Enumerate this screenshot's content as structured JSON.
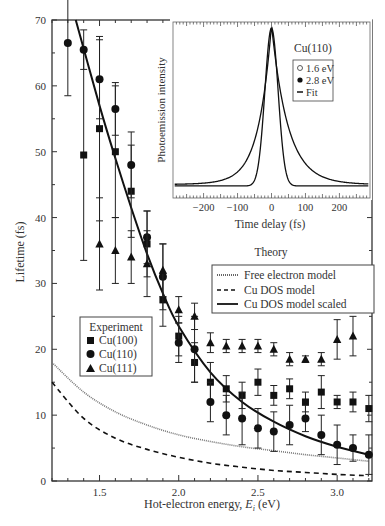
{
  "chart_data": [
    {
      "type": "scatter",
      "title": "",
      "xlabel": "Hot-electron energy, E_i (eV)",
      "xlabel_main": "Hot-electron energy, ",
      "xlabel_sym": "E",
      "xlabel_sub": "i",
      "xlabel_unit": " (eV)",
      "ylabel": "Lifetime (fs)",
      "xlim": [
        1.2,
        3.22
      ],
      "ylim": [
        0,
        70
      ],
      "xticks": [
        1.5,
        2.0,
        2.5,
        3.0
      ],
      "xtick_labels": [
        "1.5",
        "2.0",
        "2.5",
        "3.0"
      ],
      "yticks": [
        0,
        10,
        20,
        30,
        40,
        50,
        60,
        70
      ],
      "ytick_labels": [
        "0",
        "10",
        "20",
        "30",
        "40",
        "50",
        "60",
        "70"
      ],
      "grid": false,
      "legend_experiment": {
        "title": "Experiment",
        "entries": [
          "Cu(100)",
          "Cu(110)",
          "Cu(111)"
        ]
      },
      "legend_theory": {
        "title": "Theory",
        "entries": [
          "Free electron model",
          "Cu DOS model",
          "Cu DOS model scaled"
        ]
      },
      "series": [
        {
          "name": "Cu(100)",
          "marker": "square",
          "x": [
            1.4,
            1.5,
            1.6,
            1.7,
            1.8,
            1.9,
            2.0,
            2.1,
            2.2,
            2.3,
            2.4,
            2.5,
            2.6,
            2.7,
            2.8,
            2.9,
            3.0,
            3.1,
            3.2
          ],
          "y": [
            49.5,
            53.5,
            50,
            44,
            36,
            27.5,
            22,
            18,
            15,
            14,
            13,
            15,
            13,
            14,
            12,
            13.5,
            12,
            12,
            11
          ],
          "err": [
            16,
            14,
            10,
            7,
            5,
            4,
            3,
            3,
            3,
            2,
            2,
            2,
            1.5,
            1.5,
            1.5,
            2.5,
            1,
            1.5,
            2
          ]
        },
        {
          "name": "Cu(110)",
          "marker": "circle",
          "x": [
            1.3,
            1.4,
            1.5,
            1.6,
            1.7,
            1.8,
            1.9,
            2.0,
            2.1,
            2.2,
            2.3,
            2.4,
            2.5,
            2.6,
            2.7,
            2.8,
            2.9,
            3.0,
            3.1,
            3.2
          ],
          "y": [
            66.5,
            65.5,
            61,
            56.5,
            48,
            37,
            31,
            21,
            20,
            12,
            10,
            9.5,
            8,
            7.5,
            8.5,
            9.5,
            7,
            5.5,
            5,
            4
          ],
          "err": [
            8,
            3,
            6,
            4,
            5,
            4,
            5,
            3,
            5,
            3,
            3,
            4,
            3,
            3,
            3,
            2,
            3,
            3,
            2,
            3
          ]
        },
        {
          "name": "Cu(111)",
          "marker": "triangle",
          "x": [
            1.5,
            1.6,
            1.7,
            1.8,
            1.9,
            2.0,
            2.1,
            2.2,
            2.3,
            2.4,
            2.5,
            2.6,
            2.7,
            2.8,
            2.9,
            3.0,
            3.1
          ],
          "y": [
            36,
            35,
            34,
            33,
            32,
            26,
            25,
            21,
            20.5,
            20.5,
            20.5,
            20,
            18.5,
            18.5,
            18.5,
            21.5,
            22
          ],
          "err": [
            7,
            5,
            4,
            5,
            4,
            2,
            2,
            1.5,
            1,
            1,
            1,
            1,
            1,
            0.5,
            1,
            3,
            3
          ]
        },
        {
          "name": "Free electron model",
          "style": "dotted",
          "x": [
            1.2,
            1.4,
            1.6,
            1.8,
            2.0,
            2.2,
            2.4,
            2.6,
            2.8,
            3.0,
            3.2
          ],
          "y": [
            18,
            13.5,
            10.5,
            8.5,
            7,
            6,
            5.2,
            4.6,
            4,
            3.5,
            3
          ]
        },
        {
          "name": "Cu DOS model",
          "style": "dashed",
          "x": [
            1.2,
            1.4,
            1.6,
            1.8,
            2.0,
            2.2,
            2.4,
            2.6,
            2.8,
            3.0,
            3.2
          ],
          "y": [
            15,
            9.5,
            6.5,
            4.8,
            3.6,
            2.7,
            2.1,
            1.6,
            1.3,
            1.0,
            0.8
          ]
        },
        {
          "name": "Cu DOS model scaled",
          "style": "solid",
          "x": [
            1.35,
            1.5,
            1.6,
            1.7,
            1.8,
            1.9,
            2.0,
            2.2,
            2.4,
            2.6,
            2.8,
            3.0,
            3.2
          ],
          "y": [
            70,
            57,
            49,
            41.5,
            34.5,
            28.5,
            23.5,
            16.5,
            12,
            9,
            6.8,
            5.2,
            4
          ]
        }
      ]
    },
    {
      "type": "line",
      "title": "Cu(110)",
      "xlabel": "Time delay (fs)",
      "ylabel": "Photoemission intensity",
      "xlim": [
        -290,
        290
      ],
      "xticks": [
        -200,
        -100,
        0,
        100,
        200
      ],
      "xtick_labels": [
        "−200",
        "−100",
        "0",
        "100",
        "200"
      ],
      "legend": {
        "title": "Cu(110)",
        "entries": [
          "1.6 eV",
          "2.8 eV",
          "Fit"
        ]
      },
      "series": [
        {
          "name": "1.6 eV",
          "marker": "open-circle",
          "shape": "asymmetric peak at 0, decay constant ~ 60 fs"
        },
        {
          "name": "2.8 eV",
          "marker": "filled-circle",
          "shape": "narrow peak at 0, width ~ 40 fs"
        },
        {
          "name": "Fit",
          "style": "solid"
        }
      ]
    }
  ]
}
